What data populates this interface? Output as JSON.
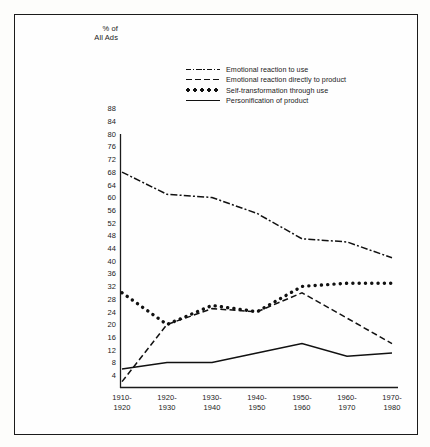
{
  "chart_data": {
    "type": "line",
    "title": "",
    "ylabel": "% of All Ads",
    "ylabel_line1": "% of",
    "ylabel_line2": "All Ads",
    "xlabel": "",
    "ylim": [
      0,
      90
    ],
    "yticks": [
      88,
      84,
      80,
      76,
      72,
      68,
      64,
      60,
      56,
      52,
      48,
      44,
      40,
      36,
      32,
      28,
      24,
      20,
      16,
      12,
      8,
      4
    ],
    "grid": false,
    "legend_position": "upper-center",
    "categories": [
      "1910-1920",
      "1920-1930",
      "1930-1940",
      "1940-1950",
      "1950-1960",
      "1960-1970",
      "1970-1980"
    ],
    "xtick_labels": [
      {
        "line1": "1910-",
        "line2": "1920"
      },
      {
        "line1": "1920-",
        "line2": "1930"
      },
      {
        "line1": "1930-",
        "line2": "1940"
      },
      {
        "line1": "1940-",
        "line2": "1950"
      },
      {
        "line1": "1950-",
        "line2": "1960"
      },
      {
        "line1": "1960-",
        "line2": "1970"
      },
      {
        "line1": "1970-",
        "line2": "1980"
      }
    ],
    "series": [
      {
        "name": "Emotional reaction to use",
        "style": "dash-dot",
        "color": "#111111",
        "values": [
          68,
          61,
          60,
          55,
          47,
          46,
          41
        ]
      },
      {
        "name": "Emotional reaction directly to product",
        "style": "dashed",
        "color": "#111111",
        "values": [
          2,
          20,
          25,
          24,
          30,
          22,
          14
        ]
      },
      {
        "name": "Self-transformation through use",
        "style": "dotted",
        "color": "#111111",
        "values": [
          30,
          20,
          26,
          24,
          32,
          33,
          33
        ]
      },
      {
        "name": "Personification of product",
        "style": "solid",
        "color": "#111111",
        "values": [
          6,
          8,
          8,
          11,
          14,
          10,
          11
        ]
      }
    ]
  },
  "legend": {
    "items": [
      {
        "label": "Emotional reaction to use",
        "style": "dash-dot"
      },
      {
        "label": "Emotional reaction directly to product",
        "style": "dashed"
      },
      {
        "label": "Self-transformation through use",
        "style": "dotted"
      },
      {
        "label": "Personification of product",
        "style": "solid"
      }
    ]
  }
}
